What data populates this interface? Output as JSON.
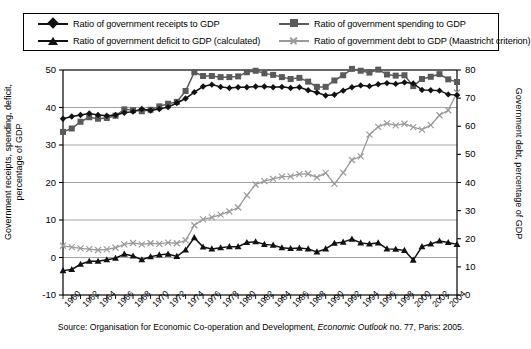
{
  "legend": {
    "items": [
      {
        "label": "Ratio of government receipts to GDP",
        "marker": "diamond-marker",
        "color": "#111111"
      },
      {
        "label": "Ratio of government spending to GDP",
        "marker": "square-marker",
        "color": "#5a5a5a"
      },
      {
        "label": "Ratio of government deficit to GDP (calculated)",
        "marker": "triangle-marker",
        "color": "#111111"
      },
      {
        "label": "Ratio of government debt to GDP (Maastricht criterion)",
        "marker": "cross-marker",
        "color": "#9a9a9a"
      }
    ]
  },
  "source": {
    "prefix": "Source: Organisation for Economic Co-operation and Development, ",
    "italic": "Economic Outlook",
    "suffix": " no. 77, Paris: 2005."
  },
  "chart_data": {
    "type": "line",
    "title": "",
    "xlabel": "",
    "ylabel": "Government receipts, spending, deficit, percentage of GDP",
    "y2label": "Government debt, percentage of GDP",
    "ylim": [
      -10,
      50
    ],
    "yticks": [
      -10,
      0,
      10,
      20,
      30,
      40,
      50
    ],
    "y2lim": [
      0,
      80
    ],
    "y2ticks": [
      0,
      10,
      20,
      30,
      40,
      50,
      60,
      70,
      80
    ],
    "grid": true,
    "legend_position": "top",
    "xlim": [
      1960,
      2005
    ],
    "x": [
      1960,
      1961,
      1962,
      1963,
      1964,
      1965,
      1966,
      1967,
      1968,
      1969,
      1970,
      1971,
      1972,
      1973,
      1974,
      1975,
      1976,
      1977,
      1978,
      1979,
      1980,
      1981,
      1982,
      1983,
      1984,
      1985,
      1986,
      1987,
      1988,
      1989,
      1990,
      1991,
      1992,
      1993,
      1994,
      1995,
      1996,
      1997,
      1998,
      1999,
      2000,
      2001,
      2002,
      2003,
      2004,
      2005
    ],
    "xtick_labels": [
      "1960",
      "1962",
      "1964",
      "1966",
      "1968",
      "1970",
      "1972",
      "1974",
      "1976",
      "1978",
      "1980",
      "1982",
      "1984",
      "1986",
      "1988",
      "1990",
      "1992",
      "1994",
      "1996",
      "1998",
      "2000",
      "2002",
      "2004"
    ],
    "series": [
      {
        "name": "Ratio of government receipts to GDP",
        "axis": "left",
        "marker": "diamond",
        "color": "#111111",
        "values": [
          37.0,
          37.6,
          38.0,
          38.4,
          38.0,
          37.8,
          38.0,
          38.6,
          38.9,
          39.6,
          39.2,
          39.6,
          40.1,
          41.2,
          42.4,
          44.1,
          45.6,
          46.1,
          45.5,
          45.2,
          45.4,
          45.4,
          45.6,
          45.6,
          45.4,
          45.5,
          45.2,
          45.4,
          44.6,
          44.0,
          43.2,
          43.4,
          44.5,
          45.4,
          45.9,
          45.7,
          46.2,
          46.5,
          46.3,
          46.7,
          46.4,
          44.7,
          44.6,
          44.5,
          43.5,
          43.3
        ]
      },
      {
        "name": "Ratio of government spending to GDP",
        "axis": "left",
        "marker": "square",
        "color": "#5a5a5a",
        "values": [
          33.5,
          34.4,
          36.2,
          37.4,
          37.0,
          37.2,
          37.8,
          39.5,
          39.3,
          39.0,
          39.4,
          40.3,
          41.0,
          41.5,
          44.4,
          49.4,
          48.4,
          48.4,
          48.1,
          48.1,
          48.3,
          49.4,
          49.8,
          49.1,
          48.7,
          48.1,
          47.6,
          47.9,
          46.9,
          45.5,
          45.5,
          47.2,
          48.6,
          50.3,
          49.8,
          49.3,
          50.1,
          48.8,
          48.5,
          48.6,
          45.7,
          47.6,
          48.2,
          48.9,
          47.5,
          46.8
        ]
      },
      {
        "name": "Ratio of government deficit to GDP (calculated)",
        "axis": "left",
        "marker": "triangle",
        "color": "#111111",
        "values": [
          -3.5,
          -3.2,
          -1.8,
          -1.0,
          -1.0,
          -0.6,
          -0.2,
          0.9,
          0.4,
          -0.6,
          0.2,
          0.7,
          0.9,
          0.3,
          2.0,
          5.3,
          2.8,
          2.3,
          2.6,
          2.9,
          2.9,
          4.0,
          4.2,
          3.5,
          3.3,
          2.6,
          2.4,
          2.5,
          2.3,
          1.5,
          2.3,
          3.8,
          4.1,
          4.9,
          3.9,
          3.6,
          3.9,
          2.3,
          2.2,
          1.9,
          -0.7,
          2.9,
          3.6,
          4.4,
          4.0,
          3.5
        ]
      },
      {
        "name": "Ratio of government debt to GDP (Maastricht criterion)",
        "axis": "right",
        "marker": "cross",
        "color": "#9a9a9a",
        "values": [
          17.5,
          17.0,
          16.6,
          16.3,
          16.0,
          16.2,
          16.8,
          18.0,
          18.5,
          18.0,
          18.4,
          18.2,
          18.6,
          18.4,
          19.4,
          24.8,
          26.9,
          27.6,
          28.6,
          29.7,
          31.1,
          35.4,
          39.3,
          40.5,
          41.3,
          42.1,
          42.2,
          43.0,
          43.1,
          41.8,
          43.4,
          39.5,
          43.5,
          48.0,
          49.3,
          57.0,
          59.8,
          61.0,
          60.3,
          60.9,
          59.7,
          58.8,
          60.4,
          63.9,
          65.7,
          72.0
        ]
      }
    ]
  }
}
